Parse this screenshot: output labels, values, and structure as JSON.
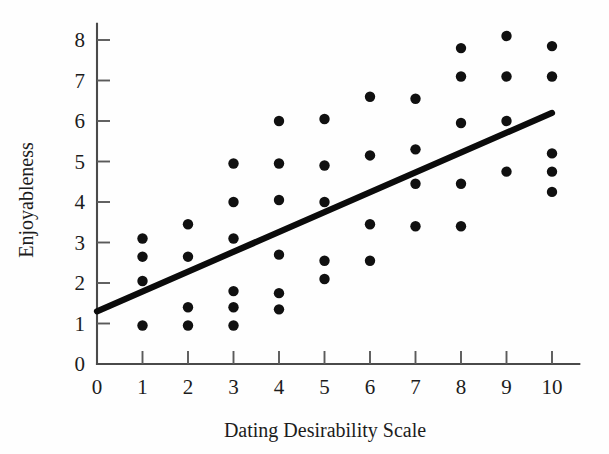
{
  "figure": {
    "background_color": "#ffffff",
    "ink_color": "#101010",
    "axis_color": "#4a4a4a"
  },
  "chart_data": {
    "type": "scatter",
    "title": "",
    "subtitle": "",
    "xlabel": "Dating Desirability Scale",
    "ylabel": "Enjoyableness",
    "xlim": [
      0,
      10.6
    ],
    "ylim": [
      0,
      8.4
    ],
    "xticks": [
      0,
      1,
      2,
      3,
      4,
      5,
      6,
      7,
      8,
      9,
      10
    ],
    "xtick_labels": [
      "0",
      "1",
      "2",
      "3",
      "4",
      "5",
      "6",
      "7",
      "8",
      "9",
      "10"
    ],
    "yticks": [
      0,
      1,
      2,
      3,
      4,
      5,
      6,
      7,
      8
    ],
    "ytick_labels": [
      "0",
      "1",
      "2",
      "3",
      "4",
      "5",
      "6",
      "7",
      "8"
    ],
    "grid": false,
    "legend": false,
    "legend_position": "none",
    "marker": "filled-circle",
    "marker_color": "#101010",
    "marker_size_px": 5.2,
    "n_points": 45,
    "points": [
      {
        "x": 1,
        "y": 3.1
      },
      {
        "x": 1,
        "y": 2.65
      },
      {
        "x": 1,
        "y": 2.05
      },
      {
        "x": 1,
        "y": 0.95
      },
      {
        "x": 2,
        "y": 3.45
      },
      {
        "x": 2,
        "y": 2.65
      },
      {
        "x": 2,
        "y": 1.4
      },
      {
        "x": 2,
        "y": 0.95
      },
      {
        "x": 3,
        "y": 4.95
      },
      {
        "x": 3,
        "y": 4.0
      },
      {
        "x": 3,
        "y": 3.1
      },
      {
        "x": 3,
        "y": 1.8
      },
      {
        "x": 3,
        "y": 1.4
      },
      {
        "x": 3,
        "y": 0.95
      },
      {
        "x": 4,
        "y": 6.0
      },
      {
        "x": 4,
        "y": 4.95
      },
      {
        "x": 4,
        "y": 4.05
      },
      {
        "x": 4,
        "y": 2.7
      },
      {
        "x": 4,
        "y": 1.75
      },
      {
        "x": 4,
        "y": 1.35
      },
      {
        "x": 5,
        "y": 6.05
      },
      {
        "x": 5,
        "y": 4.9
      },
      {
        "x": 5,
        "y": 4.0
      },
      {
        "x": 5,
        "y": 2.55
      },
      {
        "x": 5,
        "y": 2.1
      },
      {
        "x": 6,
        "y": 6.6
      },
      {
        "x": 6,
        "y": 5.15
      },
      {
        "x": 6,
        "y": 3.45
      },
      {
        "x": 6,
        "y": 2.55
      },
      {
        "x": 7,
        "y": 6.55
      },
      {
        "x": 7,
        "y": 5.3
      },
      {
        "x": 7,
        "y": 4.45
      },
      {
        "x": 7,
        "y": 3.4
      },
      {
        "x": 8,
        "y": 7.8
      },
      {
        "x": 8,
        "y": 7.1
      },
      {
        "x": 8,
        "y": 5.95
      },
      {
        "x": 8,
        "y": 4.45
      },
      {
        "x": 8,
        "y": 3.4
      },
      {
        "x": 9,
        "y": 8.1
      },
      {
        "x": 9,
        "y": 7.1
      },
      {
        "x": 9,
        "y": 6.0
      },
      {
        "x": 9,
        "y": 4.75
      },
      {
        "x": 10,
        "y": 7.85
      },
      {
        "x": 10,
        "y": 7.1
      },
      {
        "x": 10,
        "y": 5.2
      },
      {
        "x": 10,
        "y": 4.75
      },
      {
        "x": 10,
        "y": 4.25
      }
    ],
    "trendline": {
      "name": "regression-line",
      "x_start": 0,
      "y_start": 1.3,
      "x_end": 10,
      "y_end": 6.2,
      "color": "#0b0b0b",
      "width_px": 6.2
    }
  }
}
